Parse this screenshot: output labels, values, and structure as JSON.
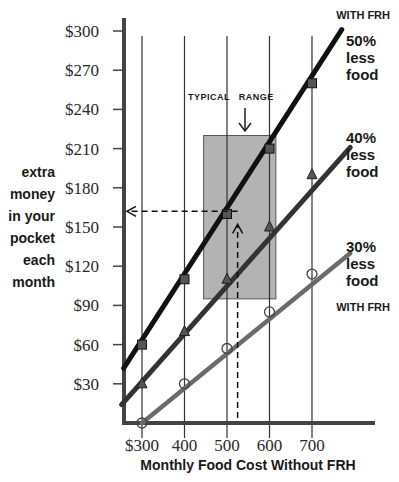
{
  "chart_data": {
    "type": "line",
    "title": "",
    "xlabel": "Monthly Food Cost Without FRH",
    "ylabel_lines": [
      "extra",
      "money",
      "in your",
      "pocket",
      "each",
      "month"
    ],
    "ylabel": "extra money in your pocket each month",
    "x": [
      300,
      400,
      500,
      600,
      700
    ],
    "x_tick_labels": [
      "$300",
      "400",
      "500",
      "600",
      "700"
    ],
    "y_ticks": [
      30,
      60,
      90,
      120,
      150,
      180,
      210,
      240,
      270,
      300
    ],
    "y_tick_labels": [
      "$30",
      "$60",
      "$90",
      "$120",
      "$150",
      "$180",
      "$210",
      "$240",
      "$270",
      "$300"
    ],
    "xlim": [
      255,
      880
    ],
    "ylim": [
      0,
      300
    ],
    "grid": "vertical lines at x ticks",
    "series": [
      {
        "name": "50% less food",
        "label_lines": [
          "50%",
          "less",
          "food"
        ],
        "marker": "square",
        "color": "#111111",
        "values": [
          60,
          110,
          160,
          210,
          260
        ],
        "line_start": {
          "x": 257,
          "y": 42
        },
        "line_end": {
          "x": 770,
          "y": 301
        }
      },
      {
        "name": "40% less food",
        "label_lines": [
          "40%",
          "less",
          "food"
        ],
        "marker": "triangle",
        "color": "#333333",
        "values": [
          30,
          70,
          110,
          150,
          190
        ],
        "line_start": {
          "x": 252,
          "y": 14
        },
        "line_end": {
          "x": 790,
          "y": 211
        }
      },
      {
        "name": "30% less food",
        "label_lines": [
          "30%",
          "less",
          "food"
        ],
        "marker": "circle",
        "color": "#6b6b6b",
        "values": [
          0,
          30,
          57,
          85,
          114
        ],
        "line_start": {
          "x": 300,
          "y": 0
        },
        "line_end": {
          "x": 790,
          "y": 130
        }
      }
    ],
    "annotations": {
      "top_label": "WITH FRH",
      "bottom_label": "WITH FRH",
      "typical_range": {
        "label_part1": "TYPICAL",
        "label_part2": "RANGE",
        "x_from": 445,
        "x_to": 615,
        "y_from": 95,
        "y_to": 220,
        "fill": "#b3b3b3"
      },
      "example": {
        "x": 525,
        "y": 162,
        "description": "dashed line from x=525 up to the 50% line, then left to the y-axis"
      }
    }
  }
}
